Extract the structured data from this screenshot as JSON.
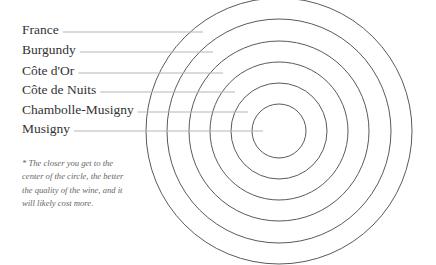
{
  "diagram": {
    "type": "concentric-circles",
    "center": {
      "x": 279,
      "y": 131
    },
    "colors": {
      "circle_stroke": "#5a5a5a",
      "leader_line": "#b5b5b5",
      "label_text": "#333333",
      "note_text": "#666666"
    },
    "levels": [
      {
        "label": "France",
        "radius": 133,
        "label_y": 32,
        "line_start": 65,
        "line_end": 203
      },
      {
        "label": "Burgundy",
        "radius": 112,
        "label_y": 52,
        "line_start": 81,
        "line_end": 213
      },
      {
        "label": "Côte d'Or",
        "radius": 90,
        "label_y": 73,
        "line_start": 80,
        "line_end": 223
      },
      {
        "label": "Côte de Nuits",
        "radius": 69,
        "label_y": 92,
        "line_start": 103,
        "line_end": 235
      },
      {
        "label": "Chambolle-Musigny",
        "radius": 48,
        "label_y": 112,
        "line_start": 137,
        "line_end": 248
      },
      {
        "label": "Musigny",
        "radius": 27,
        "label_y": 131,
        "line_start": 75,
        "line_end": 263
      }
    ],
    "note": "* The closer you get to the center of the circle, the better the quality of the wine, and it will likely cost more."
  }
}
